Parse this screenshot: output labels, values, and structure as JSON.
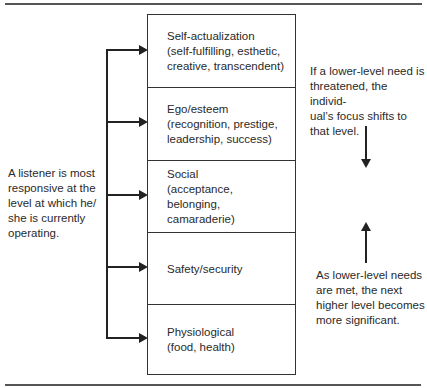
{
  "diagram": {
    "type": "hierarchy-of-needs",
    "levels": [
      {
        "title": "Self-actualization",
        "detail_lines": [
          "(self-fulfilling, esthetic,",
          "creative, transcendent)"
        ]
      },
      {
        "title": "Ego/esteem",
        "detail_lines": [
          "(recognition, prestige,",
          "leadership, success)"
        ]
      },
      {
        "title": "Social",
        "detail_lines": [
          "(acceptance,",
          "belonging,",
          "camaraderie)"
        ]
      },
      {
        "title": "Safety/security",
        "detail_lines": []
      },
      {
        "title": "Physiological",
        "detail_lines": [
          "(food, health)"
        ]
      }
    ],
    "left_note": {
      "lines": [
        "A listener is most",
        "responsive at the",
        "level at which he/",
        "she is currently",
        "operating."
      ]
    },
    "right_top_note": {
      "lines": [
        "If a lower-level need is",
        "threatened, the individ-",
        "ual’s focus shifts to",
        "that level."
      ],
      "arrow_direction": "down"
    },
    "right_bottom_note": {
      "lines": [
        "As lower-level needs",
        "are met, the next",
        "higher level becomes",
        "more significant."
      ],
      "arrow_direction": "up"
    },
    "colors": {
      "line": "#222222",
      "rule": "#555555",
      "text": "#2a2a2a",
      "background": "#ffffff"
    }
  }
}
